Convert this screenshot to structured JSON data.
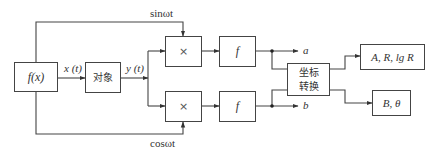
{
  "diagram": {
    "type": "block-diagram",
    "blocks": {
      "source": {
        "label": "f(x)"
      },
      "plant": {
        "label": "对象"
      },
      "multiplier_top": {
        "label": "×"
      },
      "multiplier_bottom": {
        "label": "×"
      },
      "filter_top": {
        "label": "f"
      },
      "filter_bottom": {
        "label": "f"
      },
      "coord_transform": {
        "line1": "坐标",
        "line2": "转换"
      },
      "output_top": {
        "label": "A, R, lg R"
      },
      "output_bottom": {
        "label": "B, θ"
      }
    },
    "signals": {
      "x_t": "x (t)",
      "y_t": "y (t)",
      "sin_ref": "sinωt",
      "cos_ref": "cosωt",
      "a": "a",
      "b": "b"
    },
    "edges": [
      {
        "from": "source",
        "to": "plant",
        "label": "x (t)"
      },
      {
        "from": "plant",
        "to": "multiplier_top",
        "label": "y (t)"
      },
      {
        "from": "plant",
        "to": "multiplier_bottom",
        "label": "y (t)"
      },
      {
        "from": "source",
        "to": "multiplier_top",
        "label": "sinωt"
      },
      {
        "from": "source",
        "to": "multiplier_bottom",
        "label": "cosωt"
      },
      {
        "from": "multiplier_top",
        "to": "filter_top"
      },
      {
        "from": "multiplier_bottom",
        "to": "filter_bottom"
      },
      {
        "from": "filter_top",
        "to": "output a",
        "label": "a"
      },
      {
        "from": "filter_bottom",
        "to": "output b",
        "label": "b"
      },
      {
        "from": "filter_top",
        "to": "coord_transform"
      },
      {
        "from": "filter_bottom",
        "to": "coord_transform"
      },
      {
        "from": "coord_transform",
        "to": "output_top"
      },
      {
        "from": "coord_transform",
        "to": "output_bottom"
      }
    ]
  }
}
